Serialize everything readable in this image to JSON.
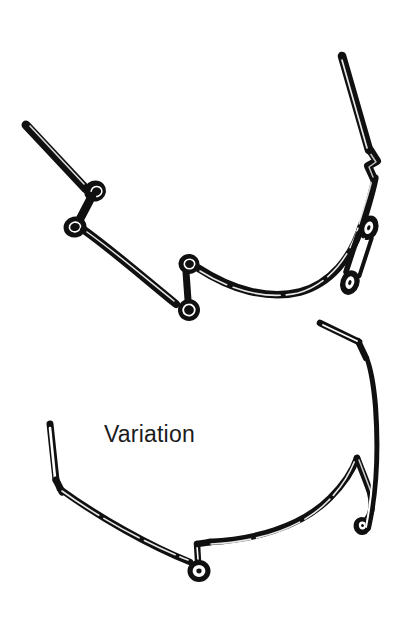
{
  "figure": {
    "title": "Variation",
    "caption_label": "Variation",
    "domain": "technical-line-illustration",
    "background_color": "#ffffff",
    "ink_color": "#101010",
    "highlight_color": "#ffffff",
    "canvas": {
      "width": 405,
      "height": 635
    },
    "parts": [
      {
        "id": "upper-assembly",
        "name": "upper-wire-assembly",
        "description": "Curved wire rim with a long straight temple arm on the left, two small coiled loops near the left-center, a double coil at mid-span, a kinked joint at upper right and an elongated spring coil on the right side.",
        "features": [
          "left-straight-arm",
          "upper-left-coil",
          "lower-left-coil",
          "center-double-loop",
          "right-kink-joint",
          "right-elongated-spring-coil",
          "right-straight-arm"
        ]
      },
      {
        "id": "lower-assembly",
        "name": "lower-wire-assembly",
        "description": "Variation form: curved wire with a straight arm angled up at left, a stepped jog with a round eyelet loop at bottom center, and a hook-shaped bend with a small loop at the right, rising to a straight arm at top right.",
        "features": [
          "left-straight-arm",
          "left-bend",
          "bottom-step-jog",
          "bottom-eyelet-loop",
          "right-hook-bend",
          "right-small-loop",
          "right-upper-bend",
          "right-straight-arm"
        ]
      }
    ]
  }
}
